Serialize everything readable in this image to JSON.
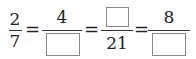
{
  "equation": {
    "fractions": [
      {
        "numerator": "2",
        "denominator": "7"
      },
      {
        "numerator": "4",
        "denominator": ""
      },
      {
        "numerator": "",
        "denominator": "21"
      },
      {
        "numerator": "8",
        "denominator": ""
      }
    ],
    "equals_sign": "="
  }
}
